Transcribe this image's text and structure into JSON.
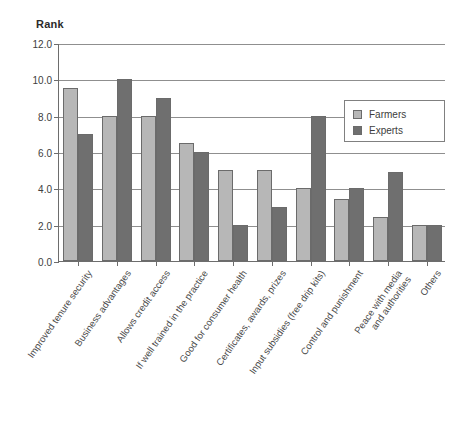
{
  "chart_data": {
    "type": "bar",
    "title": "Rank",
    "xlabel": "",
    "ylabel": "Rank",
    "ylim": [
      0,
      12
    ],
    "ytick_step": 2,
    "ytick_labels": [
      "0.0",
      "2.0",
      "4.0",
      "6.0",
      "8.0",
      "10.0",
      "12.0"
    ],
    "grid": true,
    "legend_position": "upper-right",
    "categories": [
      "Improved tenure security",
      "Business advantages",
      "Allows credit access",
      "If well trained in the practice",
      "Good for consumer health",
      "Certificates, awards, prizes",
      "Input subsidies (free drip kits)",
      "Control and punishment",
      "Peace with media\nand authorities",
      "Others"
    ],
    "series": [
      {
        "name": "Farmers",
        "color": "#b7b7b7",
        "values": [
          9.5,
          8.0,
          8.0,
          6.5,
          5.0,
          5.0,
          4.0,
          3.4,
          2.4,
          2.0
        ]
      },
      {
        "name": "Experts",
        "color": "#6f6f6f",
        "values": [
          7.0,
          10.0,
          9.0,
          6.0,
          2.0,
          3.0,
          8.0,
          4.0,
          4.9,
          2.0
        ]
      }
    ]
  },
  "legend": {
    "items": [
      {
        "label": "Farmers"
      },
      {
        "label": "Experts"
      }
    ]
  },
  "colors": {
    "farmers_bar": "#b7b7b7",
    "experts_bar": "#6f6f6f",
    "axis": "#6d6d6d",
    "gridline": "#8f8f8f",
    "background": "#ffffff"
  }
}
